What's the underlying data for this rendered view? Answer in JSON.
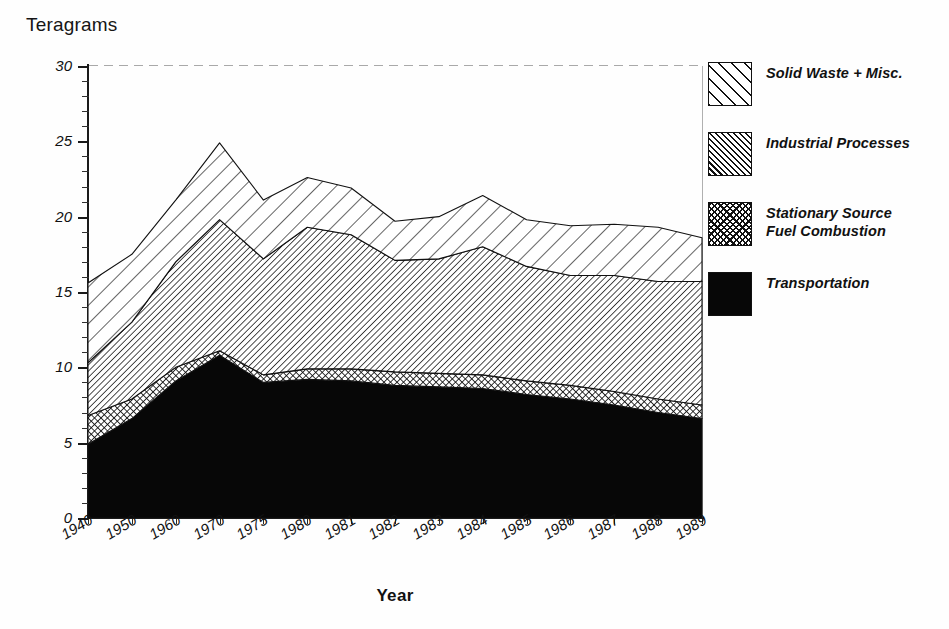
{
  "chart_data": {
    "type": "area",
    "subtype": "stacked-area",
    "title": "",
    "ylabel": "Teragrams",
    "xlabel": "Year",
    "ylim": [
      0,
      30
    ],
    "yticks": [
      0,
      5,
      10,
      15,
      20,
      25,
      30
    ],
    "ytick_labels": [
      "0",
      "5",
      "10",
      "15",
      "20",
      "25",
      "30"
    ],
    "minor_tick_step": 1,
    "grid": false,
    "legend_position": "right",
    "categories": [
      "1940",
      "1950",
      "1960",
      "1970",
      "1975",
      "1980",
      "1981",
      "1982",
      "1983",
      "1984",
      "1985",
      "1986",
      "1987",
      "1988",
      "1989"
    ],
    "stack_order_bottom_to_top": [
      "Transportation",
      "Stationary Source Fuel Combustion",
      "Industrial Processes",
      "Solid Waste + Misc."
    ],
    "series": [
      {
        "name": "Transportation",
        "pattern": "solid-black",
        "color": "#070707",
        "values": [
          4.9,
          6.6,
          9.1,
          10.8,
          9.0,
          9.2,
          9.1,
          8.8,
          8.7,
          8.6,
          8.2,
          7.9,
          7.5,
          7.0,
          6.6
        ]
      },
      {
        "name": "Stationary Source Fuel Combustion",
        "pattern": "checkerboard",
        "color": "#6f6f6f",
        "values": [
          1.9,
          1.3,
          0.9,
          0.3,
          0.5,
          0.7,
          0.8,
          0.9,
          0.9,
          0.9,
          0.9,
          0.9,
          0.9,
          0.9,
          0.9
        ]
      },
      {
        "name": "Industrial Processes",
        "pattern": "dense-diagonal-hatch",
        "color": "#8f8f8f",
        "values": [
          3.5,
          5.1,
          7.0,
          8.7,
          7.7,
          9.4,
          8.9,
          7.4,
          7.6,
          8.5,
          7.6,
          7.3,
          7.7,
          7.8,
          8.2
        ]
      },
      {
        "name": "Solid Waste + Misc.",
        "pattern": "wide-diagonal-hatch",
        "color": "#ffffff",
        "values": [
          5.3,
          4.5,
          4.1,
          5.1,
          3.9,
          3.3,
          3.1,
          2.6,
          2.8,
          3.4,
          3.1,
          3.3,
          3.4,
          3.6,
          2.9
        ]
      }
    ],
    "cumulative_tops": {
      "Transportation": [
        4.9,
        6.6,
        9.1,
        10.8,
        9.0,
        9.2,
        9.1,
        8.8,
        8.7,
        8.6,
        8.2,
        7.9,
        7.5,
        7.0,
        6.6
      ],
      "Stationary Source Fuel Combustion": [
        6.8,
        7.9,
        10.0,
        11.1,
        9.5,
        9.9,
        9.9,
        9.7,
        9.6,
        9.5,
        9.1,
        8.8,
        8.4,
        7.9,
        7.5
      ],
      "Industrial Processes": [
        10.3,
        13.0,
        17.0,
        19.8,
        17.2,
        19.3,
        18.8,
        17.1,
        17.2,
        18.0,
        16.7,
        16.1,
        16.1,
        15.7,
        15.7
      ],
      "Total": [
        15.6,
        17.5,
        21.1,
        24.9,
        21.1,
        22.6,
        21.9,
        19.7,
        20.0,
        21.4,
        19.8,
        19.4,
        19.5,
        19.3,
        18.6
      ]
    }
  },
  "axis": {
    "y_title": "Teragrams",
    "x_title": "Year"
  },
  "legend": {
    "items": [
      {
        "label": "Solid Waste + Misc.",
        "swatch": "wide-diagonal-hatch-swatch"
      },
      {
        "label": "Industrial Processes",
        "swatch": "dense-diagonal-hatch-swatch"
      },
      {
        "label": "Stationary Source\nFuel Combustion",
        "swatch": "checkerboard-swatch"
      },
      {
        "label": "Transportation",
        "swatch": "solid-black-swatch"
      }
    ]
  }
}
